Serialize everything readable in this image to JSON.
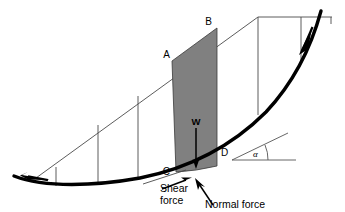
{
  "figure": {
    "type": "engineering-diagram"
  },
  "colors": {
    "background": "#ffffff",
    "slice_fill": "#808080",
    "slip_surface": "#000000",
    "thin_line": "#4a4a4a",
    "text": "#000000"
  },
  "labels": {
    "point_a": "A",
    "point_b": "B",
    "point_c": "C",
    "point_d": "D",
    "weight": "W",
    "alpha": "α",
    "shear_force_line1": "Shear",
    "shear_force_line2": "force",
    "normal_force": "Normal force"
  },
  "geometry": {
    "slip_surface_points": "14,176 60,185 110,184 160,176 200,162 235,142 262,116 285,86 302,56 313,30 320,12",
    "slope_line_points": "36,178 258,17 332,17",
    "slice_polygon": "172,61 217,28 217,166 176,172",
    "vertical_slices": [
      {
        "name": "slice-line-1",
        "x1": 56,
        "y1": 184,
        "x2": 56,
        "y2": 184
      },
      {
        "name": "slice-line-2",
        "x1": 56.5,
        "y1": 184.6,
        "x2": 56.5,
        "y2": 184.6
      }
    ],
    "slice_line_coords": [
      {
        "id": "v1",
        "x_top": 56,
        "y_top": 163,
        "x_bot": 56,
        "y_bot": 185
      },
      {
        "id": "v2",
        "x_top": 98,
        "y_top": 123,
        "x_bot": 98,
        "y_bot": 185
      },
      {
        "id": "v3",
        "x_top": 138,
        "y_top": 94,
        "x_bot": 138,
        "y_bot": 181
      },
      {
        "id": "v4",
        "x_top": 256,
        "y_top": 17,
        "x_bot": 256,
        "y_bot": 110
      },
      {
        "id": "v5",
        "x_top": 300,
        "y_top": 17,
        "x_bot": 300,
        "y_bot": 60
      }
    ],
    "weight_arrow": {
      "x": 196,
      "y_start": 127,
      "y_end": 167
    },
    "alpha_angle_degrees": 22
  },
  "annotations": {
    "rotation_arrow_lower_left": "slip-direction-arrow-left",
    "rotation_arrow_upper_right": "slip-direction-arrow-right",
    "shear_force_arrow": "shear-force-arrow",
    "normal_force_arrow": "normal-force-arrow"
  }
}
